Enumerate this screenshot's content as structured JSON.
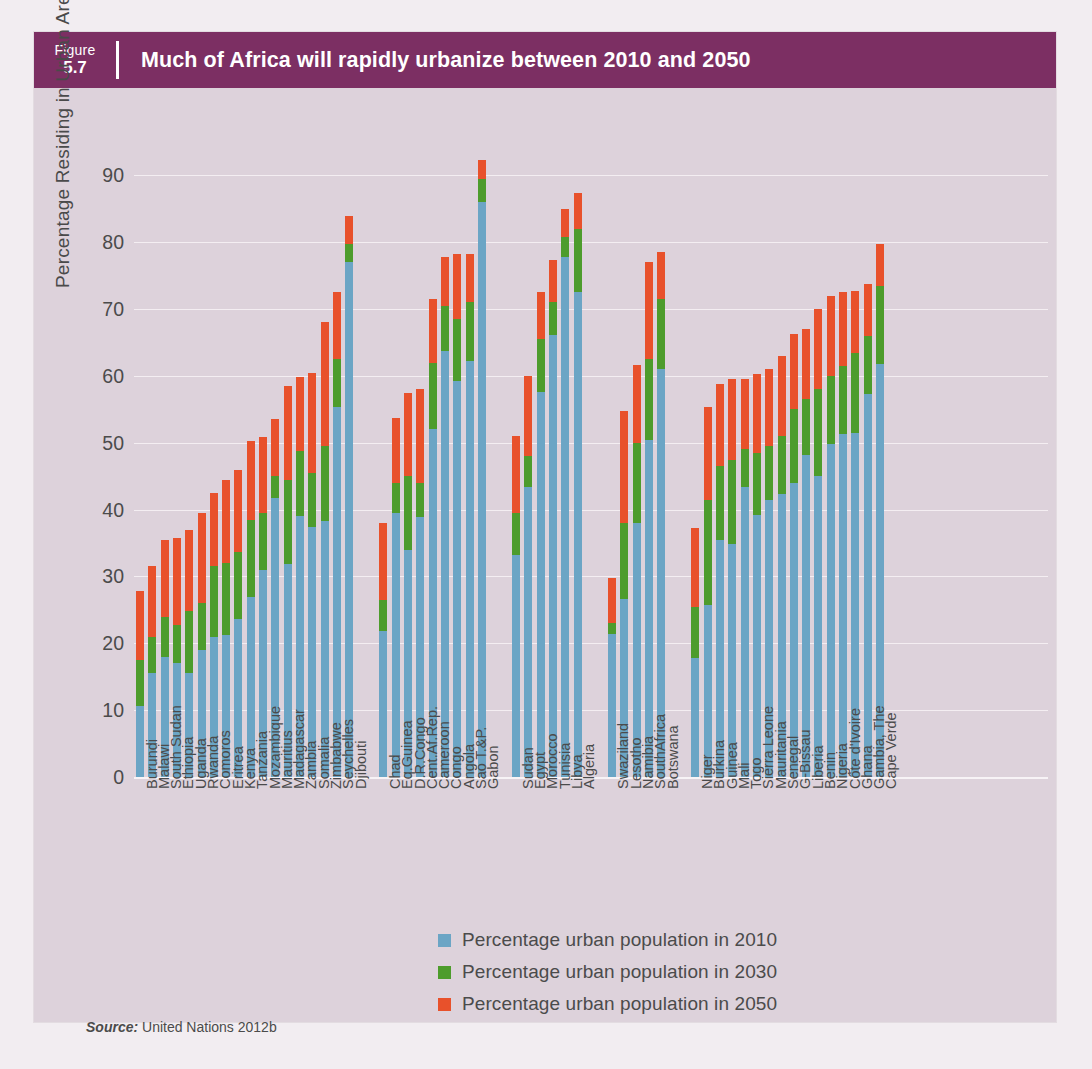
{
  "header": {
    "figure_word": "Figure",
    "figure_number": "5.7",
    "title": "Much of Africa will rapidly urbanize between 2010 and 2050"
  },
  "source": {
    "prefix": "Source:",
    "text": "United Nations 2012b"
  },
  "legend": {
    "position": "bottom-center",
    "items": [
      {
        "label": "Percentage urban population in 2010",
        "color": "#6ba5c5"
      },
      {
        "label": "Percentage urban population in 2030",
        "color": "#4d9c2c"
      },
      {
        "label": "Percentage urban population in 2050",
        "color": "#e8512b"
      }
    ]
  },
  "chart_data": {
    "type": "bar",
    "stacked": true,
    "title": "Much of Africa will rapidly urbanize between 2010 and 2050",
    "xlabel": "",
    "ylabel": "Percentage Residing in Urban Areas",
    "ylim": [
      0,
      95
    ],
    "yticks": [
      0,
      10,
      20,
      30,
      40,
      50,
      60,
      70,
      80,
      90
    ],
    "ytick_labels": [
      "0",
      "10",
      "20",
      "30",
      "40",
      "50",
      "60",
      "70",
      "80",
      "90"
    ],
    "grid": true,
    "legend": [
      "Percentage urban population in 2010",
      "Percentage urban population in 2030",
      "Percentage urban population in 2050"
    ],
    "series_colors": {
      "2010": "#6ba5c5",
      "2030": "#4d9c2c",
      "2050": "#e8512b"
    },
    "note": "Each bar is a cumulative stack: top of blue = 2010 value, top of green = 2030 value, top of red = 2050 value.",
    "groups": [
      {
        "name": "East Africa",
        "countries": [
          {
            "label": "Burundi",
            "v2010": 10.6,
            "v2030": 17.5,
            "v2050": 27.8
          },
          {
            "label": "Malawi",
            "v2010": 15.5,
            "v2030": 21.0,
            "v2050": 31.5
          },
          {
            "label": "South Sudan",
            "v2010": 18.0,
            "v2030": 24.0,
            "v2050": 35.5
          },
          {
            "label": "Ethiopia",
            "v2010": 17.0,
            "v2030": 22.8,
            "v2050": 35.8
          },
          {
            "label": "Uganda",
            "v2010": 15.5,
            "v2030": 24.8,
            "v2050": 37.0
          },
          {
            "label": "Rwanda",
            "v2010": 19.0,
            "v2030": 26.0,
            "v2050": 39.5
          },
          {
            "label": "Comoros",
            "v2010": 21.0,
            "v2030": 31.5,
            "v2050": 42.5
          },
          {
            "label": "Eritrea",
            "v2010": 21.3,
            "v2030": 32.0,
            "v2050": 44.5
          },
          {
            "label": "Kenya",
            "v2010": 23.6,
            "v2030": 33.6,
            "v2050": 46.0
          },
          {
            "label": "Tanzania",
            "v2010": 27.0,
            "v2030": 38.5,
            "v2050": 50.3
          },
          {
            "label": "Mozambique",
            "v2010": 31.0,
            "v2030": 39.5,
            "v2050": 50.8
          },
          {
            "label": "Mauritius",
            "v2010": 41.8,
            "v2030": 45.0,
            "v2050": 53.5
          },
          {
            "label": "Madagascar",
            "v2010": 31.9,
            "v2030": 44.5,
            "v2050": 58.5
          },
          {
            "label": "Zambia",
            "v2010": 39.0,
            "v2030": 48.8,
            "v2050": 59.8
          },
          {
            "label": "Somalia",
            "v2010": 37.4,
            "v2030": 45.5,
            "v2050": 60.5
          },
          {
            "label": "Zimbabwe",
            "v2010": 38.3,
            "v2030": 49.5,
            "v2050": 68.0
          },
          {
            "label": "Seychelles",
            "v2010": 55.3,
            "v2030": 62.5,
            "v2050": 72.5
          },
          {
            "label": "Djibouti",
            "v2010": 77.1,
            "v2030": 79.8,
            "v2050": 84.0
          }
        ]
      },
      {
        "name": "Central Africa",
        "countries": [
          {
            "label": "Chad",
            "v2010": 21.8,
            "v2030": 26.5,
            "v2050": 38.0
          },
          {
            "label": "Eq.Guinea",
            "v2010": 39.5,
            "v2030": 44.0,
            "v2050": 53.7
          },
          {
            "label": "D.R.Congo",
            "v2010": 34.0,
            "v2030": 45.0,
            "v2050": 57.5
          },
          {
            "label": "Cent.Af.Rep.",
            "v2010": 38.9,
            "v2030": 44.0,
            "v2050": 58.0
          },
          {
            "label": "Cameroon",
            "v2010": 52.1,
            "v2030": 62.0,
            "v2050": 71.5
          },
          {
            "label": "Congo",
            "v2010": 63.7,
            "v2030": 70.5,
            "v2050": 77.8
          },
          {
            "label": "Angola",
            "v2010": 59.2,
            "v2030": 68.5,
            "v2050": 78.3
          },
          {
            "label": "Sao T.&P.",
            "v2010": 62.2,
            "v2030": 71.0,
            "v2050": 78.3
          },
          {
            "label": "Gabon",
            "v2010": 86.0,
            "v2030": 89.5,
            "v2050": 92.3
          }
        ]
      },
      {
        "name": "North Africa",
        "countries": [
          {
            "label": "Sudan",
            "v2010": 33.2,
            "v2030": 39.5,
            "v2050": 51.0
          },
          {
            "label": "Egypt",
            "v2010": 43.4,
            "v2030": 48.0,
            "v2050": 60.0
          },
          {
            "label": "Morocco",
            "v2010": 57.6,
            "v2030": 65.5,
            "v2050": 72.6
          },
          {
            "label": "Tunisia",
            "v2010": 66.1,
            "v2030": 71.0,
            "v2050": 77.3
          },
          {
            "label": "Libya",
            "v2010": 77.8,
            "v2030": 80.8,
            "v2050": 85.0
          },
          {
            "label": "Algeria",
            "v2010": 72.5,
            "v2030": 82.0,
            "v2050": 87.3
          }
        ]
      },
      {
        "name": "Southern Africa",
        "countries": [
          {
            "label": "Swaziland",
            "v2010": 21.4,
            "v2030": 23.0,
            "v2050": 29.8
          },
          {
            "label": "Lesotho",
            "v2010": 26.6,
            "v2030": 38.0,
            "v2050": 54.7
          },
          {
            "label": "Namibia",
            "v2010": 38.0,
            "v2030": 50.0,
            "v2050": 61.7
          },
          {
            "label": "SouthAfrica",
            "v2010": 50.4,
            "v2030": 62.5,
            "v2050": 77.0
          },
          {
            "label": "Botswana",
            "v2010": 61.1,
            "v2030": 71.5,
            "v2050": 78.5
          }
        ]
      },
      {
        "name": "West Africa",
        "countries": [
          {
            "label": "Niger",
            "v2010": 17.8,
            "v2030": 25.5,
            "v2050": 37.2
          },
          {
            "label": "Burkina",
            "v2010": 25.7,
            "v2030": 41.5,
            "v2050": 55.4
          },
          {
            "label": "Guinea",
            "v2010": 35.4,
            "v2030": 46.5,
            "v2050": 58.8
          },
          {
            "label": "Mali",
            "v2010": 34.9,
            "v2030": 47.5,
            "v2050": 59.6
          },
          {
            "label": "Togo",
            "v2010": 43.4,
            "v2030": 49.0,
            "v2050": 59.6
          },
          {
            "label": "Sierra Leone",
            "v2010": 39.2,
            "v2030": 48.5,
            "v2050": 60.3
          },
          {
            "label": "Mauritania",
            "v2010": 41.4,
            "v2030": 49.5,
            "v2050": 61.0
          },
          {
            "label": "Senegal",
            "v2010": 42.4,
            "v2030": 51.0,
            "v2050": 63.0
          },
          {
            "label": "G-Bissau",
            "v2010": 44.0,
            "v2030": 55.0,
            "v2050": 66.3
          },
          {
            "label": "Liberia",
            "v2010": 48.2,
            "v2030": 56.5,
            "v2050": 67.0
          },
          {
            "label": "Benin",
            "v2010": 45.0,
            "v2030": 58.0,
            "v2050": 70.0
          },
          {
            "label": "Nigeria",
            "v2010": 49.8,
            "v2030": 60.0,
            "v2050": 72.0
          },
          {
            "label": "Côte d'Ivoire",
            "v2010": 51.3,
            "v2030": 61.5,
            "v2050": 72.5
          },
          {
            "label": "Ghana",
            "v2010": 51.5,
            "v2030": 63.5,
            "v2050": 72.7
          },
          {
            "label": "Gambia, The",
            "v2010": 57.3,
            "v2030": 66.0,
            "v2050": 73.8
          },
          {
            "label": "Cape Verde",
            "v2010": 61.8,
            "v2030": 73.5,
            "v2050": 79.7
          }
        ]
      }
    ]
  }
}
